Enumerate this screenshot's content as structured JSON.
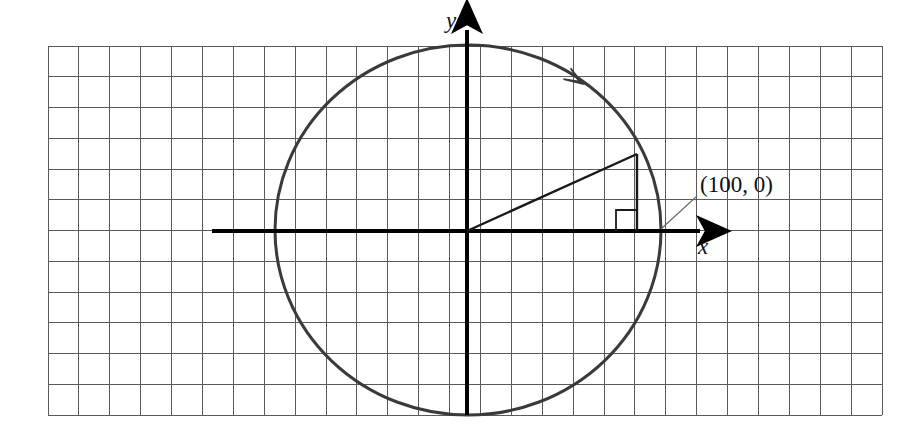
{
  "figure": {
    "background_color": "#ffffff",
    "width": 920,
    "height": 436
  },
  "grid": {
    "name": "graph-paper-grid",
    "left": 48,
    "top": 46,
    "right": 882,
    "bottom": 415,
    "columns": 27,
    "rows": 12,
    "cell_size": 30.9,
    "line_color": "#5a5a5a",
    "line_width": 1
  },
  "axes": {
    "origin": {
      "x": 467,
      "y": 231
    },
    "color": "#000000",
    "line_width": 4,
    "x_axis": {
      "name": "x-axis",
      "label": "x",
      "start_x": 212,
      "end_x": 712,
      "y": 231,
      "label_x": 703,
      "label_y": 254,
      "label_font_size": 23,
      "arrow": "right"
    },
    "y_axis": {
      "name": "y-axis",
      "label": "y",
      "x": 467,
      "start_y": 415,
      "end_y": 18,
      "label_x": 451,
      "label_y": 28,
      "label_font_size": 23,
      "arrow": "up"
    }
  },
  "circle": {
    "name": "circle-path",
    "center_x": 468,
    "center_y": 230,
    "radius_x": 193,
    "radius_y": 185,
    "stroke_color": "#3a3a3a",
    "stroke_width": 3,
    "direction": "counterclockwise",
    "direction_arrow": {
      "x": 583,
      "y": 84,
      "rotation_deg": 213
    }
  },
  "triangle": {
    "name": "reference-triangle",
    "stroke_color": "#1a1a1a",
    "stroke_width": 2,
    "vertices": {
      "origin": {
        "x": 467,
        "y": 231
      },
      "point_on_circle": {
        "x": 637,
        "y": 154
      },
      "foot": {
        "x": 637,
        "y": 231
      }
    },
    "right_angle_marker": {
      "name": "right-angle-marker",
      "x": 616,
      "y": 210,
      "size": 21
    }
  },
  "annotation": {
    "name": "point-callout",
    "label": "(100, 0)",
    "label_x": 700,
    "label_y": 192,
    "label_font_size": 23,
    "leader_line": {
      "x1": 697,
      "y1": 196,
      "x2": 661,
      "y2": 229,
      "color": "#6a6a6a",
      "width": 1.2
    }
  },
  "chart_data": {
    "type": "scatter",
    "xlabel": "x",
    "ylabel": "y",
    "grid": true,
    "legend": null,
    "annotations": [
      {
        "text": "(100, 0)",
        "x": 100,
        "y": 0
      }
    ],
    "shapes": [
      {
        "kind": "circle",
        "cx": 0,
        "cy": 0,
        "r": 100,
        "direction": "counterclockwise"
      },
      {
        "kind": "segment",
        "from": [
          0,
          0
        ],
        "to": [
          55,
          25
        ]
      },
      {
        "kind": "segment",
        "from": [
          55,
          25
        ],
        "to": [
          55,
          0
        ]
      },
      {
        "kind": "segment",
        "from": [
          0,
          0
        ],
        "to": [
          55,
          0
        ]
      }
    ],
    "xlim": [
      -135,
      130
    ],
    "ylim": [
      -100,
      100
    ]
  }
}
